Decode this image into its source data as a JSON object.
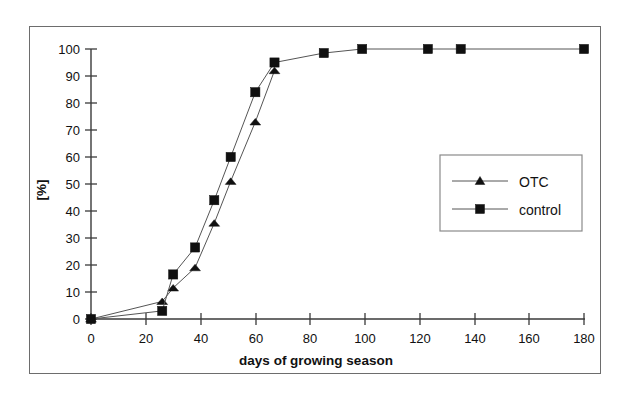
{
  "chart_data": {
    "type": "line",
    "title": "",
    "xlabel": "days of growing season",
    "ylabel": "[%]",
    "xlim": [
      0,
      180
    ],
    "ylim": [
      0,
      100
    ],
    "xticks": [
      0,
      20,
      40,
      60,
      80,
      100,
      120,
      140,
      160,
      180
    ],
    "xtick_labels": [
      "0",
      "20",
      "40",
      "60",
      "80",
      "100",
      "120",
      "140",
      "160",
      "180"
    ],
    "yticks": [
      0,
      10,
      20,
      30,
      40,
      50,
      60,
      70,
      80,
      90,
      100
    ],
    "ytick_labels": [
      "0",
      "10",
      "20",
      "30",
      "40",
      "50",
      "60",
      "70",
      "80",
      "90",
      "100"
    ],
    "grid": false,
    "legend_position": "center-right",
    "series": [
      {
        "name": "OTC",
        "marker": "triangle",
        "color": "#101010",
        "x": [
          0,
          26,
          30,
          38,
          45,
          51,
          60,
          67
        ],
        "values": [
          0,
          6.5,
          11.5,
          19,
          35.5,
          51,
          73,
          92
        ]
      },
      {
        "name": "control",
        "marker": "square",
        "color": "#101010",
        "x": [
          0,
          26,
          30,
          38,
          45,
          51,
          60,
          67,
          85,
          99,
          123,
          135,
          180
        ],
        "values": [
          0,
          3,
          16.5,
          26.5,
          44,
          60,
          84,
          95,
          98.5,
          100,
          100,
          100,
          100
        ]
      }
    ]
  },
  "legend": {
    "entries": [
      {
        "label": "OTC",
        "marker": "triangle"
      },
      {
        "label": "control",
        "marker": "square"
      }
    ]
  },
  "axes": {
    "x_title": "days of growing season",
    "y_title": "[%]"
  }
}
